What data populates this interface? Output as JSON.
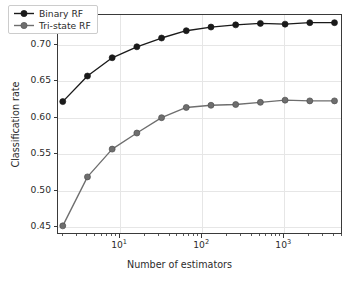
{
  "chart_data": {
    "type": "line",
    "title": "",
    "xlabel": "Number of estimators",
    "ylabel": "Classification rate",
    "xscale": "log",
    "yscale": "linear",
    "xlim": [
      1.75,
      5200
    ],
    "ylim": [
      0.4395,
      0.7405
    ],
    "grid": true,
    "legend_position": "upper left",
    "x": [
      2,
      4,
      8,
      16,
      32,
      64,
      128,
      256,
      512,
      1024,
      2048,
      4096
    ],
    "xtick_labels": [
      "10^1",
      "10^2",
      "10^3"
    ],
    "xtick_values": [
      10,
      100,
      1000
    ],
    "ytick_labels": [
      "0.45",
      "0.50",
      "0.55",
      "0.60",
      "0.65",
      "0.70"
    ],
    "ytick_values": [
      0.45,
      0.5,
      0.55,
      0.6,
      0.65,
      0.7
    ],
    "series": [
      {
        "name": "Binary RF",
        "color": "#1a1a1a",
        "marker": "circle",
        "values": [
          0.622,
          0.657,
          0.682,
          0.697,
          0.709,
          0.719,
          0.724,
          0.727,
          0.729,
          0.728,
          0.73,
          0.73
        ]
      },
      {
        "name": "Tri-state RF",
        "color": "#6e6e6e",
        "marker": "circle",
        "values": [
          0.452,
          0.519,
          0.557,
          0.579,
          0.6,
          0.614,
          0.617,
          0.618,
          0.621,
          0.624,
          0.623,
          0.623
        ]
      }
    ]
  },
  "legend": {
    "items": [
      {
        "label": "Binary RF",
        "color": "#1a1a1a"
      },
      {
        "label": "Tri-state RF",
        "color": "#6e6e6e"
      }
    ]
  },
  "axes": {
    "x_title": "Number of estimators",
    "y_title": "Classification rate"
  }
}
